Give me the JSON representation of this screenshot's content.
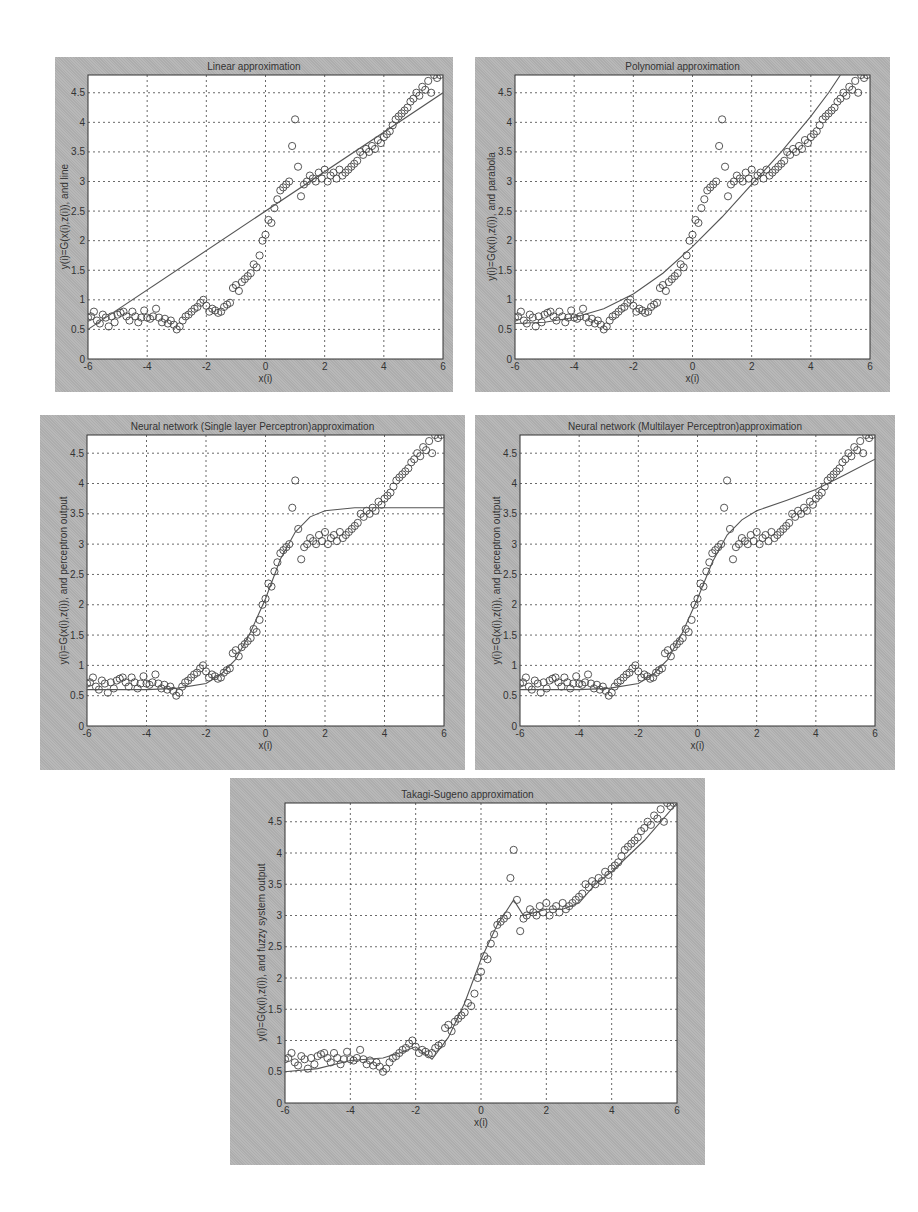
{
  "figure": {
    "background": "#ffffff",
    "panel_color": "#b4b4b4",
    "axes_color": "#ffffff",
    "line_color": "#555555",
    "marker_color": "#444444"
  },
  "chart_data": [
    {
      "id": "linear",
      "type": "scatter+line",
      "title": "Linear approximation",
      "xlabel": "x(i)",
      "ylabel": "y(i)=G(x(i),z(i)), and line",
      "xlim": [
        -6,
        6
      ],
      "ylim": [
        0,
        4.8
      ],
      "xticks": [
        "-6",
        "-4",
        "-2",
        "0",
        "2",
        "4",
        "6"
      ],
      "yticks": [
        "0",
        "0.5",
        "1",
        "1.5",
        "2",
        "2.5",
        "3",
        "3.5",
        "4",
        "4.5"
      ],
      "grid": true,
      "panel": {
        "left": 55,
        "top": 57,
        "width": 398,
        "height": 335,
        "ax_left": 33,
        "ax_top": 18,
        "ax_width": 355,
        "ax_height": 284
      },
      "curve": {
        "x": [
          -6,
          6
        ],
        "y": [
          0.5,
          4.5
        ]
      }
    },
    {
      "id": "polynomial",
      "type": "scatter+line",
      "title": "Polynomial approximation",
      "xlabel": "x(i)",
      "ylabel": "y(i)=G(x(i),z(i)), and parabola",
      "xlim": [
        -6,
        6
      ],
      "ylim": [
        0,
        4.8
      ],
      "xticks": [
        "-6",
        "-4",
        "-2",
        "0",
        "2",
        "4",
        "6"
      ],
      "yticks": [
        "0",
        "0.5",
        "1",
        "1.5",
        "2",
        "2.5",
        "3",
        "3.5",
        "4",
        "4.5"
      ],
      "grid": true,
      "panel": {
        "left": 475,
        "top": 57,
        "width": 415,
        "height": 335,
        "ax_left": 40,
        "ax_top": 18,
        "ax_width": 355,
        "ax_height": 284
      },
      "curve": {
        "x": [
          -6,
          -5,
          -4,
          -3,
          -2,
          -1,
          0,
          1,
          2,
          3,
          4,
          4.6,
          5.0
        ],
        "y": [
          0.6,
          0.62,
          0.7,
          0.85,
          1.1,
          1.45,
          1.9,
          2.4,
          2.95,
          3.5,
          4.1,
          4.5,
          4.8
        ]
      }
    },
    {
      "id": "slp",
      "type": "scatter+line",
      "title": "Neural network (Single layer Perceptron)approximation",
      "xlabel": "x(i)",
      "ylabel": "y(i)=G(x(i),z(i)), and perceptron output",
      "xlim": [
        -6,
        6
      ],
      "ylim": [
        0,
        4.8
      ],
      "xticks": [
        "-6",
        "-4",
        "-2",
        "0",
        "2",
        "4",
        "6"
      ],
      "yticks": [
        "0",
        "0.5",
        "1",
        "1.5",
        "2",
        "2.5",
        "3",
        "3.5",
        "4",
        "4.5"
      ],
      "grid": true,
      "panel": {
        "left": 40,
        "top": 415,
        "width": 425,
        "height": 355,
        "ax_left": 47,
        "ax_top": 20,
        "ax_width": 357,
        "ax_height": 291
      },
      "curve": {
        "x": [
          -6,
          -4,
          -3,
          -2,
          -1.5,
          -1,
          -0.5,
          0,
          0.5,
          1,
          1.5,
          2,
          3,
          4,
          6
        ],
        "y": [
          0.6,
          0.6,
          0.62,
          0.7,
          0.85,
          1.1,
          1.55,
          2.1,
          2.75,
          3.2,
          3.45,
          3.55,
          3.6,
          3.6,
          3.6
        ]
      }
    },
    {
      "id": "mlp",
      "type": "scatter+line",
      "title": "Neural network (Multilayer Perceptron)approximation",
      "xlabel": "x(i)",
      "ylabel": "y(i)=G(x(i),z(i)), and perceptron output",
      "xlim": [
        -6,
        6
      ],
      "ylim": [
        0,
        4.8
      ],
      "xticks": [
        "-6",
        "-4",
        "-2",
        "0",
        "2",
        "4",
        "6"
      ],
      "yticks": [
        "0",
        "0.5",
        "1",
        "1.5",
        "2",
        "2.5",
        "3",
        "3.5",
        "4",
        "4.5"
      ],
      "grid": true,
      "panel": {
        "left": 475,
        "top": 415,
        "width": 420,
        "height": 355,
        "ax_left": 45,
        "ax_top": 20,
        "ax_width": 355,
        "ax_height": 291
      },
      "curve": {
        "x": [
          -6,
          -4,
          -3,
          -2,
          -1.5,
          -1,
          -0.5,
          0,
          0.5,
          1,
          1.5,
          2,
          3,
          4,
          5,
          6
        ],
        "y": [
          0.6,
          0.6,
          0.62,
          0.7,
          0.85,
          1.1,
          1.55,
          2.1,
          2.7,
          3.15,
          3.4,
          3.55,
          3.72,
          3.9,
          4.15,
          4.4
        ]
      }
    },
    {
      "id": "ts",
      "type": "scatter+line",
      "title": "Takagi-Sugeno approximation",
      "xlabel": "x(i)",
      "ylabel": "y(i)=G(x(i),z(i)), and fuzzy system output",
      "xlim": [
        -6,
        6
      ],
      "ylim": [
        0,
        4.8
      ],
      "xticks": [
        "-6",
        "-4",
        "-2",
        "0",
        "2",
        "4",
        "6"
      ],
      "yticks": [
        "0",
        "0.5",
        "1",
        "1.5",
        "2",
        "2.5",
        "3",
        "3.5",
        "4",
        "4.5"
      ],
      "grid": true,
      "panel": {
        "left": 230,
        "top": 778,
        "width": 475,
        "height": 387,
        "ax_left": 55,
        "ax_top": 25,
        "ax_width": 392,
        "ax_height": 300
      },
      "curve": {
        "x": [
          -6,
          -5,
          -4,
          -3,
          -2.5,
          -2,
          -1.5,
          -1,
          -0.5,
          0,
          0.5,
          1,
          1.3,
          2,
          2.5,
          3,
          3.5,
          4,
          5,
          6
        ],
        "y": [
          0.5,
          0.55,
          0.68,
          0.72,
          0.8,
          0.9,
          0.7,
          1.05,
          1.6,
          2.3,
          2.85,
          3.25,
          3.0,
          3.1,
          3.1,
          3.2,
          3.5,
          3.7,
          4.2,
          4.8
        ]
      }
    }
  ],
  "observations": {
    "x": [
      -6,
      -5.9,
      -5.8,
      -5.7,
      -5.6,
      -5.5,
      -5.4,
      -5.3,
      -5.2,
      -5.1,
      -5.0,
      -4.9,
      -4.8,
      -4.7,
      -4.6,
      -4.5,
      -4.4,
      -4.3,
      -4.2,
      -4.1,
      -4.0,
      -3.9,
      -3.8,
      -3.7,
      -3.6,
      -3.5,
      -3.4,
      -3.3,
      -3.2,
      -3.1,
      -3.0,
      -2.9,
      -2.8,
      -2.7,
      -2.6,
      -2.5,
      -2.4,
      -2.3,
      -2.2,
      -2.1,
      -2.0,
      -1.9,
      -1.8,
      -1.7,
      -1.6,
      -1.5,
      -1.4,
      -1.3,
      -1.2,
      -1.1,
      -1.0,
      -0.9,
      -0.8,
      -0.7,
      -0.6,
      -0.5,
      -0.4,
      -0.3,
      -0.2,
      -0.1,
      0.0,
      0.1,
      0.2,
      0.3,
      0.4,
      0.5,
      0.6,
      0.7,
      0.8,
      0.9,
      1.0,
      1.1,
      1.2,
      1.3,
      1.4,
      1.5,
      1.6,
      1.7,
      1.8,
      1.9,
      2.0,
      2.1,
      2.2,
      2.3,
      2.4,
      2.5,
      2.6,
      2.7,
      2.8,
      2.9,
      3.0,
      3.1,
      3.2,
      3.3,
      3.4,
      3.5,
      3.6,
      3.7,
      3.8,
      3.9,
      4.0,
      4.1,
      4.2,
      4.3,
      4.4,
      4.5,
      4.6,
      4.7,
      4.8,
      4.9,
      5.0,
      5.1,
      5.2,
      5.3,
      5.4,
      5.5,
      5.6,
      5.7,
      5.8,
      5.9
    ],
    "y": [
      0.7,
      0.72,
      0.8,
      0.65,
      0.6,
      0.75,
      0.7,
      0.55,
      0.72,
      0.62,
      0.75,
      0.78,
      0.8,
      0.72,
      0.65,
      0.8,
      0.72,
      0.62,
      0.7,
      0.82,
      0.7,
      0.68,
      0.72,
      0.85,
      0.7,
      0.62,
      0.68,
      0.6,
      0.65,
      0.58,
      0.5,
      0.55,
      0.65,
      0.72,
      0.75,
      0.8,
      0.85,
      0.88,
      0.95,
      1.0,
      0.9,
      0.8,
      0.85,
      0.82,
      0.78,
      0.8,
      0.88,
      0.92,
      0.95,
      1.2,
      1.25,
      1.15,
      1.3,
      1.35,
      1.4,
      1.45,
      1.6,
      1.55,
      1.75,
      2.0,
      2.1,
      2.35,
      2.3,
      2.55,
      2.7,
      2.85,
      2.9,
      2.95,
      3.0,
      3.6,
      4.05,
      3.25,
      2.75,
      2.95,
      3.0,
      3.1,
      3.05,
      3.0,
      3.15,
      3.05,
      3.2,
      3.0,
      3.1,
      3.15,
      3.05,
      3.2,
      3.1,
      3.15,
      3.2,
      3.25,
      3.3,
      3.35,
      3.5,
      3.45,
      3.55,
      3.5,
      3.6,
      3.55,
      3.7,
      3.65,
      3.75,
      3.8,
      3.85,
      3.95,
      4.05,
      4.1,
      4.15,
      4.2,
      4.25,
      4.35,
      4.4,
      4.5,
      4.45,
      4.6,
      4.55,
      4.7,
      4.5,
      4.8,
      4.75,
      4.8
    ]
  }
}
